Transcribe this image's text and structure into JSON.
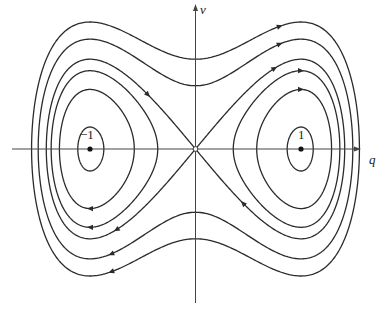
{
  "figure": {
    "type": "phase-portrait",
    "axes": {
      "x_label": "q",
      "y_label": "v",
      "tick_labels": [
        {
          "text": "−1",
          "q": -1
        },
        {
          "text": "1",
          "q": 1
        }
      ]
    },
    "equilibria": [
      {
        "q": -1,
        "v": 0,
        "kind": "center",
        "marker": "filled"
      },
      {
        "q": 1,
        "v": 0,
        "kind": "center",
        "marker": "filled"
      },
      {
        "q": 0,
        "v": 0,
        "kind": "saddle",
        "marker": "open"
      }
    ],
    "hamiltonian": "H = v^2/2 - q^2/2 + q^4/4",
    "level_sets": [
      0.25,
      0.124,
      0.0,
      -0.06,
      -0.14,
      -0.235
    ],
    "colors": {
      "line": "#2b2b2b",
      "axis": "#444444",
      "background": "#ffffff"
    }
  },
  "layout": {
    "origin_px": [
      195.5,
      149
    ],
    "q_scale_px": 105.5,
    "v_scale_px": 127,
    "x_axis_range_px": [
      12,
      356
    ],
    "y_axis_range_px": [
      4,
      303
    ]
  }
}
